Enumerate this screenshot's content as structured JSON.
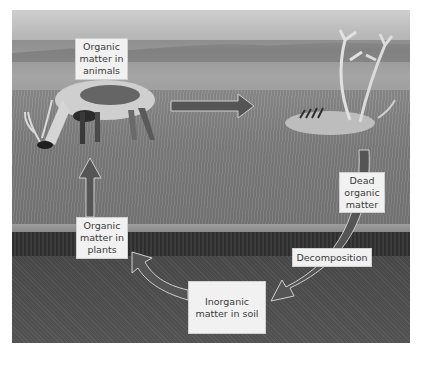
{
  "diagram": {
    "style": "grayscale photo background with arrow cycle",
    "nodes": [
      {
        "id": "animals",
        "label": "Organic matter in animals"
      },
      {
        "id": "dead",
        "label": "Dead organic matter"
      },
      {
        "id": "soil",
        "label": "Inorganic matter in soil"
      },
      {
        "id": "plants",
        "label": "Organic matter in plants"
      }
    ],
    "process_label": "Decomposition",
    "edges": [
      {
        "from": "animals",
        "to": "dead"
      },
      {
        "from": "dead",
        "to": "soil",
        "label": "Decomposition"
      },
      {
        "from": "soil",
        "to": "plants"
      },
      {
        "from": "plants",
        "to": "animals"
      }
    ]
  },
  "labels": {
    "animals_line1": "Organic",
    "animals_line2": "matter in",
    "animals_line3": "animals",
    "dead_line1": "Dead",
    "dead_line2": "organic",
    "dead_line3": "matter",
    "decomposition": "Decomposition",
    "soil_line1": "Inorganic",
    "soil_line2": "matter in soil",
    "plants_line1": "Organic",
    "plants_line2": "matter in",
    "plants_line3": "plants"
  },
  "colors": {
    "arrow_fill": "#555555",
    "arrow_outline": "#c8c8c8",
    "label_bg": "#f1f1f1",
    "label_text": "#3b3b3b"
  }
}
